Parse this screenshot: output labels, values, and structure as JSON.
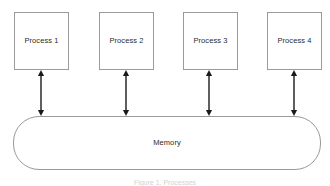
{
  "diagram": {
    "background_color": "#ffffff",
    "stroke_color": "#9a9a9a",
    "arrow_color": "#1a1a1a",
    "text_color": "#2b2b2b",
    "caption": "Figure 1. Processes",
    "processes": [
      {
        "label": "Process 1",
        "x": 14,
        "y": 12,
        "w": 55,
        "h": 58
      },
      {
        "label": "Process 2",
        "x": 99,
        "y": 12,
        "w": 55,
        "h": 58
      },
      {
        "label": "Process 3",
        "x": 183,
        "y": 12,
        "w": 55,
        "h": 58
      },
      {
        "label": "Process 4",
        "x": 267,
        "y": 12,
        "w": 55,
        "h": 58
      }
    ],
    "memory": {
      "label": "Memory",
      "x": 13,
      "y": 116,
      "w": 308,
      "h": 54,
      "corner_radius": 26
    },
    "connectors": [
      {
        "name": "process-1-memory",
        "x": 41,
        "y_top": 70,
        "y_bottom": 116,
        "double_headed": true
      },
      {
        "name": "process-2-memory",
        "x": 126,
        "y_top": 70,
        "y_bottom": 116,
        "double_headed": true
      },
      {
        "name": "process-3-memory",
        "x": 209,
        "y_top": 70,
        "y_bottom": 116,
        "double_headed": true
      },
      {
        "name": "process-4-memory",
        "x": 294,
        "y_top": 70,
        "y_bottom": 116,
        "double_headed": true
      }
    ]
  }
}
